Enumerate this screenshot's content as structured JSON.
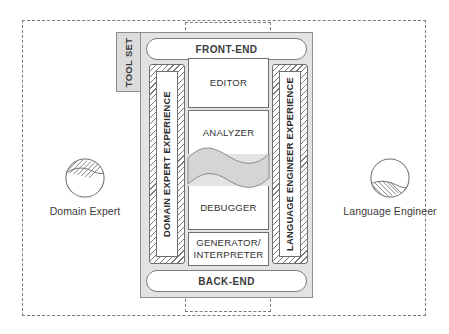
{
  "diagram": {
    "toolset": {
      "label": "TOOL SET"
    },
    "bars": {
      "front_end": "FRONT-END",
      "back_end": "BACK-END"
    },
    "experiences": [
      {
        "id": "domain-expert-experience",
        "label": "DOMAIN EXPERT EXPERIENCE"
      },
      {
        "id": "language-engineer-experience",
        "label": "LANGUAGE ENGINEER EXPERIENCE"
      }
    ],
    "components": [
      {
        "id": "editor",
        "label": "EDITOR"
      },
      {
        "id": "analyzer",
        "label": "ANALYZER"
      },
      {
        "id": "debugger",
        "label": "DEBUGGER"
      },
      {
        "id": "generator",
        "line1": "GENERATOR/",
        "line2": "INTERPRETER"
      }
    ],
    "actors": [
      {
        "id": "domain-expert",
        "label": "Domain Expert"
      },
      {
        "id": "language-engineer",
        "label": "Language Engineer"
      }
    ],
    "colors": {
      "background": "#ffffff",
      "container_fill": "#e3e3e3",
      "tab_fill": "#dcdcdc",
      "band_fill": "#d5d5d5",
      "stroke": "#6e6e6e",
      "dashed_stroke": "#7a7a7a",
      "text": "#3b3b3b"
    }
  }
}
